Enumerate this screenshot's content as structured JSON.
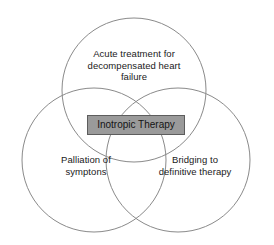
{
  "diagram": {
    "type": "venn",
    "background_color": "#ffffff",
    "circle_stroke_color": "#8a8a8a",
    "label_text_color": "#1a1a1a",
    "center": {
      "label": "Inotropic Therapy",
      "fill_color": "#9a9a9a",
      "border_color": "#5d5d5d",
      "text_color": "#141414"
    },
    "sets": [
      {
        "id": "top",
        "label": "Acute treatment for\ndecompensated heart\nfailure",
        "cx": 134,
        "cy": 90,
        "r": 72
      },
      {
        "id": "left",
        "label": "Palliation of\nsymptons",
        "cx": 94,
        "cy": 160,
        "r": 72
      },
      {
        "id": "right",
        "label": "Bridging to\ndefinitive therapy",
        "cx": 178,
        "cy": 160,
        "r": 72
      }
    ]
  }
}
